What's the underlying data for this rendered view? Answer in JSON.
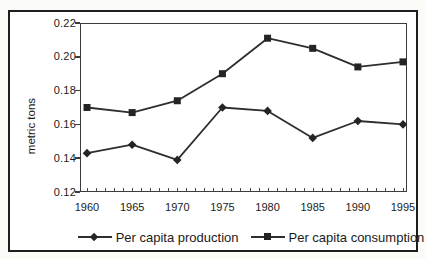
{
  "window": {
    "background": "#fbfbf8",
    "frame_border_color": "#1e1e1e",
    "plot_border_color": "#3b3b3b",
    "text_color": "#1a1a1a"
  },
  "chart_data": {
    "type": "line",
    "title": "",
    "xlabel": "",
    "ylabel": "metric tons",
    "categories": [
      "1960",
      "1965",
      "1970",
      "1975",
      "1980",
      "1985",
      "1990",
      "1995"
    ],
    "series": [
      {
        "name": "Per capita production",
        "marker": "diamond",
        "color": "#2e2e2e",
        "values": [
          0.143,
          0.148,
          0.139,
          0.17,
          0.168,
          0.152,
          0.162,
          0.16
        ]
      },
      {
        "name": "Per capita consumption",
        "marker": "square",
        "color": "#2e2e2e",
        "values": [
          0.17,
          0.167,
          0.174,
          0.19,
          0.211,
          0.205,
          0.194,
          0.197
        ]
      }
    ],
    "ylim": [
      0.12,
      0.22
    ],
    "ytick_step": 0.02,
    "ytick_labels": [
      "0.22",
      "0.20",
      "0.18",
      "0.16",
      "0.14",
      "0.12"
    ],
    "xtick_minor_per_interval": 5,
    "grid": false,
    "legend_position": "bottom",
    "marker_fill": "#242424"
  }
}
